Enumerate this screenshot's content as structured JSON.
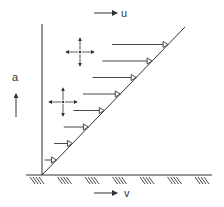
{
  "diagram": {
    "labels": {
      "top_velocity": "u",
      "bottom_velocity": "v",
      "height": "a"
    },
    "profile": {
      "shape": "linear",
      "arrow_count": 8,
      "arrow_head_style": "open-triangle"
    },
    "stress_crosses": {
      "count": 2
    },
    "ground": {
      "hatch_groups": 7
    },
    "colors": {
      "ink": "#333333",
      "background": "#ffffff"
    }
  }
}
